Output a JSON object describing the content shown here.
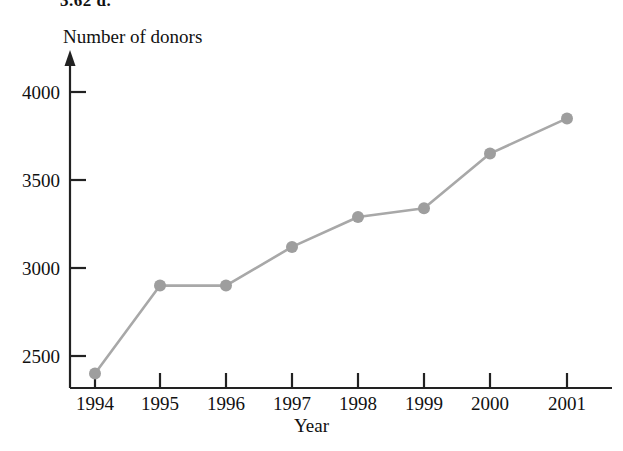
{
  "page": {
    "exercise_label": "3.62 d.",
    "background_color": "#ffffff"
  },
  "chart_data": {
    "type": "line",
    "title": "",
    "subtitle": "",
    "xlabel": "Year",
    "ylabel": "Number of donors",
    "categories": [
      "1994",
      "1995",
      "1996",
      "1997",
      "1998",
      "1999",
      "2000",
      "2001"
    ],
    "values": [
      2400,
      2900,
      2900,
      3120,
      3290,
      3340,
      3650,
      3850
    ],
    "x": [
      1994,
      1995,
      1996,
      1997,
      1998,
      1999,
      2000,
      2001
    ],
    "xlim": [
      1993.55,
      2001.85
    ],
    "ylim": [
      2300,
      4090
    ],
    "ytick_labels": [
      "4000",
      "3500",
      "3000",
      "2500"
    ],
    "yticks": [
      4000,
      3500,
      3000,
      2500
    ],
    "xtick_labels": [
      "1994",
      "1995",
      "1996",
      "1997",
      "1998",
      "1999",
      "2000",
      "2001"
    ],
    "grid": false,
    "legend": false,
    "legend_position": "none",
    "series": [
      {
        "name": "Number of donors",
        "values": [
          2400,
          2900,
          2900,
          3120,
          3290,
          3340,
          3650,
          3850
        ]
      }
    ],
    "annotations": [],
    "colors": {
      "line": "#a8a8a8",
      "marker": "#9e9e9e",
      "axis": "#222222",
      "text": "#111111"
    },
    "marker": "circle",
    "marker_size": 6,
    "line_width": 2.5,
    "y_axis_has_arrow": true,
    "x_axis_has_arrow": false
  }
}
